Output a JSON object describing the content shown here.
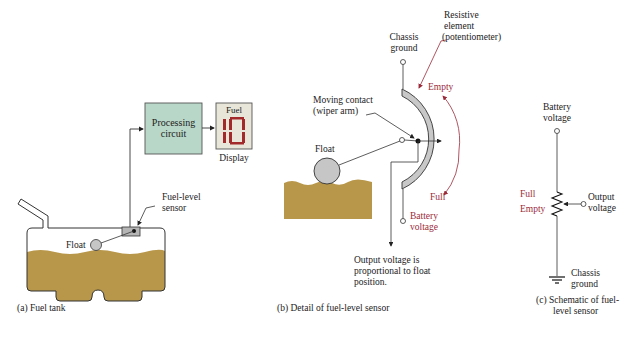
{
  "panel_a": {
    "processing_label_1": "Processing",
    "processing_label_2": "circuit",
    "display_title": "Fuel",
    "display_value": "10",
    "display_label": "Display",
    "sensor_label_1": "Fuel-level",
    "sensor_label_2": "sensor",
    "float_label": "Float",
    "caption": "(a)  Fuel tank"
  },
  "panel_b": {
    "chassis_1": "Chassis",
    "chassis_2": "ground",
    "resistive_1": "Resistive",
    "resistive_2": "element",
    "resistive_3": "(potentiometer)",
    "empty": "Empty",
    "full": "Full",
    "moving_1": "Moving contact",
    "moving_2": "(wiper arm)",
    "float_label": "Float",
    "battery_1": "Battery",
    "battery_2": "voltage",
    "output_1": "Output voltage is",
    "output_2": "proportional to float",
    "output_3": "position.",
    "caption": "(b)  Detail of fuel-level sensor"
  },
  "panel_c": {
    "battery_1": "Battery",
    "battery_2": "voltage",
    "full": "Full",
    "empty": "Empty",
    "output_1": "Output",
    "output_2": "voltage",
    "chassis_1": "Chassis",
    "chassis_2": "ground",
    "caption_1": "(c)  Schematic of fuel-",
    "caption_2": "level sensor"
  },
  "colors": {
    "fuel": "#b8974a",
    "box_fill": "#b9d7c8",
    "display_fill": "#e8e6d8",
    "segment": "#a32a2a",
    "label_red": "#9b2b3a",
    "element_gray": "#c8c8c8"
  }
}
